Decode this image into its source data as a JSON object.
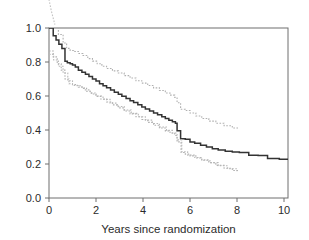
{
  "chart_data": {
    "type": "line",
    "subtype": "kaplan-meier-step",
    "title": "",
    "xlabel": "Years since randomization",
    "ylabel": "",
    "xlim": [
      -0.4,
      10.4
    ],
    "ylim": [
      -0.06,
      1.06
    ],
    "xticks": [
      0,
      2,
      4,
      6,
      8,
      10
    ],
    "xtick_labels": [
      "0",
      "2",
      "4",
      "6",
      "8",
      "10"
    ],
    "yticks": [
      0.0,
      0.2,
      0.4,
      0.6,
      0.8,
      1.0
    ],
    "ytick_labels": [
      "0.0",
      "0.2",
      "0.4",
      "0.6",
      "0.8",
      "1.0"
    ],
    "grid": false,
    "legend": false,
    "legend_position": "none",
    "colors": {
      "estimate": "#333333",
      "confidence_band": "#b0b0b0",
      "axis": "#6e6e6e",
      "text": "#2b2b2b",
      "background": "#ffffff"
    },
    "series": [
      {
        "name": "Survival estimate",
        "style": "solid",
        "color": "#333333",
        "x": [
          0.0,
          0.18,
          0.3,
          0.42,
          0.55,
          0.68,
          0.78,
          0.9,
          1.0,
          1.12,
          1.25,
          1.4,
          1.55,
          1.7,
          1.85,
          2.0,
          2.15,
          2.3,
          2.45,
          2.62,
          2.78,
          2.95,
          3.1,
          3.28,
          3.45,
          3.6,
          3.78,
          3.95,
          4.1,
          4.28,
          4.45,
          4.62,
          4.8,
          4.95,
          5.1,
          5.25,
          5.38,
          5.45,
          5.6,
          5.8,
          6.0,
          6.2,
          6.45,
          6.7,
          6.95,
          7.2,
          7.5,
          7.8,
          8.1,
          8.5,
          8.9,
          9.3,
          9.8,
          10.35
        ],
        "y": [
          1.0,
          0.955,
          0.93,
          0.905,
          0.88,
          0.805,
          0.795,
          0.79,
          0.782,
          0.77,
          0.752,
          0.74,
          0.728,
          0.715,
          0.7,
          0.688,
          0.672,
          0.66,
          0.648,
          0.636,
          0.622,
          0.61,
          0.598,
          0.586,
          0.572,
          0.562,
          0.548,
          0.536,
          0.524,
          0.512,
          0.5,
          0.49,
          0.478,
          0.468,
          0.458,
          0.448,
          0.44,
          0.395,
          0.348,
          0.345,
          0.33,
          0.322,
          0.31,
          0.3,
          0.29,
          0.282,
          0.275,
          0.27,
          0.268,
          0.252,
          0.25,
          0.232,
          0.228,
          0.19
        ]
      },
      {
        "name": "Upper 95% confidence limit",
        "style": "dotted",
        "color": "#b0b0b0",
        "x": [
          0.0,
          0.2,
          0.4,
          0.6,
          0.75,
          0.9,
          1.05,
          1.25,
          1.45,
          1.65,
          1.85,
          2.05,
          2.25,
          2.45,
          2.7,
          2.95,
          3.2,
          3.45,
          3.7,
          3.95,
          4.2,
          4.45,
          4.7,
          4.95,
          5.15,
          5.35,
          5.45,
          5.6,
          5.8,
          6.0,
          6.25,
          6.5,
          6.8,
          7.1,
          7.45,
          7.8,
          8.05
        ],
        "y": [
          1.06,
          1.015,
          0.962,
          0.912,
          0.88,
          0.868,
          0.862,
          0.85,
          0.838,
          0.82,
          0.805,
          0.79,
          0.775,
          0.762,
          0.748,
          0.735,
          0.72,
          0.706,
          0.69,
          0.676,
          0.662,
          0.648,
          0.632,
          0.618,
          0.605,
          0.592,
          0.56,
          0.522,
          0.515,
          0.5,
          0.482,
          0.468,
          0.452,
          0.44,
          0.425,
          0.412,
          0.408
        ]
      },
      {
        "name": "Lower 95% confidence limit",
        "style": "dotted",
        "color": "#b0b0b0",
        "x": [
          0.0,
          0.18,
          0.35,
          0.52,
          0.68,
          0.85,
          1.0,
          1.2,
          1.4,
          1.6,
          1.8,
          2.0,
          2.2,
          2.45,
          2.7,
          2.95,
          3.2,
          3.45,
          3.7,
          3.95,
          4.2,
          4.45,
          4.7,
          4.95,
          5.15,
          5.35,
          5.45,
          5.62,
          5.8,
          6.0,
          6.25,
          6.5,
          6.8,
          7.1,
          7.45,
          7.8,
          8.05
        ],
        "y": [
          0.865,
          0.83,
          0.79,
          0.752,
          0.7,
          0.672,
          0.668,
          0.66,
          0.645,
          0.628,
          0.612,
          0.598,
          0.582,
          0.565,
          0.548,
          0.53,
          0.512,
          0.495,
          0.478,
          0.462,
          0.445,
          0.428,
          0.412,
          0.395,
          0.382,
          0.368,
          0.33,
          0.268,
          0.258,
          0.248,
          0.235,
          0.222,
          0.208,
          0.192,
          0.175,
          0.162,
          0.155
        ]
      },
      {
        "name": "Lower 95% confidence limit secondary trace",
        "style": "dotted",
        "color": "#b8b8b8",
        "x": [
          0.0,
          0.2,
          0.4,
          0.6,
          0.8,
          1.0,
          1.25,
          1.5,
          1.75,
          2.0,
          2.3,
          2.6,
          2.9,
          3.2,
          3.5,
          3.8,
          4.1,
          4.4,
          4.7,
          5.0,
          5.25,
          5.45,
          5.65,
          5.9,
          6.2,
          6.5,
          6.85,
          7.2,
          7.6,
          8.0
        ],
        "y": [
          0.845,
          0.812,
          0.775,
          0.735,
          0.69,
          0.662,
          0.652,
          0.636,
          0.618,
          0.6,
          0.58,
          0.558,
          0.538,
          0.518,
          0.498,
          0.478,
          0.458,
          0.438,
          0.418,
          0.398,
          0.382,
          0.342,
          0.272,
          0.252,
          0.238,
          0.224,
          0.208,
          0.19,
          0.172,
          0.158
        ]
      },
      {
        "name": "Overflow trace above panel",
        "style": "dotted",
        "color": "#c4c4c4",
        "x": [
          -0.32,
          -0.2,
          -0.05,
          0.1,
          0.25
        ],
        "y": [
          1.42,
          1.32,
          1.2,
          1.1,
          1.02
        ]
      }
    ],
    "annotations": []
  },
  "axis": {
    "xlabel": "Years since randomization",
    "xtick_labels": [
      "0",
      "2",
      "4",
      "6",
      "8",
      "10"
    ],
    "ytick_labels": [
      "0.0",
      "0.2",
      "0.4",
      "0.6",
      "0.8",
      "1.0"
    ]
  }
}
